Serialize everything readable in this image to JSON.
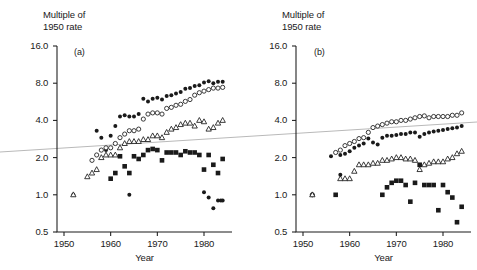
{
  "figure": {
    "background_color": "#ffffff",
    "ink_color": "#1a1a1a",
    "trendline_color": "#b9b9b9",
    "axis_title_line1": "Multiple of",
    "axis_title_line2": "1950 rate",
    "xaxis_label": "Year"
  },
  "annotation_line": {
    "description": "faint grey diagonal line spanning full image width",
    "x1": 0,
    "y1": 152,
    "x2": 477,
    "y2": 122
  },
  "panels": [
    {
      "id": "a",
      "letter": "(a)"
    },
    {
      "id": "b",
      "letter": "(b)"
    }
  ],
  "axes": {
    "y_ticks": [
      "16.0",
      "8.0",
      "4.0",
      "2.0",
      "1.0",
      "0.5"
    ],
    "y_tick_values": [
      16.0,
      8.0,
      4.0,
      2.0,
      1.0,
      0.5
    ],
    "x_ticks": [
      "1950",
      "1960",
      "1970",
      "1980"
    ],
    "x_tick_values": [
      1950,
      1960,
      1970,
      1980
    ],
    "y_scale": "log",
    "ylim": [
      0.5,
      16.0
    ],
    "xlim": [
      1948.5,
      1986.0
    ]
  },
  "chart_data": [
    {
      "type": "scatter",
      "panel": "(a)",
      "title": "Multiple of 1950 rate",
      "xlabel": "Year",
      "ylabel": "Multiple of 1950 rate",
      "yscale": "log",
      "ylim": [
        0.5,
        16.0
      ],
      "xlim": [
        1948.5,
        1986.0
      ],
      "grid": false,
      "legend": "none",
      "series": [
        {
          "name": "filled-circle",
          "marker": "filled circle",
          "x": [
            1952,
            1957,
            1958,
            1959,
            1960,
            1961,
            1962,
            1963,
            1964,
            1965,
            1966,
            1967,
            1968,
            1969,
            1970,
            1971,
            1972,
            1973,
            1974,
            1975,
            1976,
            1977,
            1978,
            1979,
            1980,
            1981,
            1982,
            1983,
            1984
          ],
          "y": [
            1.0,
            3.3,
            2.9,
            2.3,
            3.0,
            3.6,
            4.3,
            4.4,
            4.3,
            4.3,
            4.5,
            6.0,
            5.7,
            6.0,
            6.1,
            5.9,
            6.3,
            6.4,
            6.6,
            6.8,
            7.2,
            7.3,
            7.6,
            7.7,
            8.1,
            8.3,
            8.0,
            8.2,
            8.2
          ]
        },
        {
          "name": "open-circle",
          "marker": "open circle",
          "x": [
            1956,
            1957,
            1958,
            1959,
            1960,
            1961,
            1962,
            1963,
            1964,
            1965,
            1966,
            1967,
            1968,
            1969,
            1970,
            1971,
            1972,
            1973,
            1974,
            1975,
            1976,
            1977,
            1978,
            1979,
            1980,
            1981,
            1982,
            1983,
            1984
          ],
          "y": [
            1.9,
            2.1,
            2.3,
            2.4,
            2.4,
            2.6,
            2.9,
            3.1,
            3.3,
            3.3,
            3.4,
            4.1,
            4.5,
            4.6,
            4.6,
            4.5,
            5.0,
            5.1,
            5.3,
            5.4,
            5.7,
            5.9,
            6.4,
            6.7,
            6.9,
            7.1,
            7.3,
            7.3,
            7.4
          ]
        },
        {
          "name": "open-triangle",
          "marker": "open triangle",
          "x": [
            1952,
            1955,
            1956,
            1957,
            1958,
            1959,
            1960,
            1961,
            1962,
            1963,
            1964,
            1965,
            1966,
            1967,
            1968,
            1969,
            1970,
            1971,
            1972,
            1973,
            1974,
            1975,
            1976,
            1977,
            1978,
            1979,
            1980,
            1981,
            1982,
            1983,
            1984
          ],
          "y": [
            1.0,
            1.4,
            1.5,
            1.6,
            2.0,
            2.1,
            2.1,
            2.1,
            2.4,
            2.6,
            2.7,
            2.7,
            2.7,
            2.8,
            2.8,
            3.0,
            3.0,
            2.9,
            3.2,
            3.4,
            3.5,
            3.7,
            3.8,
            3.8,
            3.6,
            4.0,
            3.9,
            3.4,
            3.5,
            3.8,
            4.0
          ]
        },
        {
          "name": "filled-square",
          "marker": "filled square",
          "x": [
            1960,
            1961,
            1962,
            1963,
            1964,
            1965,
            1966,
            1967,
            1968,
            1969,
            1970,
            1971,
            1972,
            1973,
            1974,
            1975,
            1976,
            1977,
            1978,
            1979,
            1980,
            1981,
            1982,
            1983,
            1984
          ],
          "y": [
            1.35,
            1.5,
            2.05,
            1.7,
            1.5,
            2.05,
            1.95,
            2.1,
            2.3,
            2.35,
            2.3,
            1.9,
            2.2,
            2.2,
            2.2,
            2.1,
            2.25,
            2.2,
            2.2,
            2.1,
            1.6,
            2.1,
            1.75,
            1.5,
            1.95
          ]
        },
        {
          "name": "filled-circle-low",
          "marker": "filled circle",
          "x": [
            1964,
            1980,
            1981,
            1982,
            1983,
            1983.6,
            1984
          ],
          "y": [
            1.0,
            1.05,
            0.95,
            0.78,
            0.9,
            0.9,
            0.9
          ]
        }
      ]
    },
    {
      "type": "scatter",
      "panel": "(b)",
      "title": "Multiple of 1950 rate",
      "xlabel": "Year",
      "ylabel": "Multiple of 1950 rate",
      "yscale": "log",
      "ylim": [
        0.5,
        16.0
      ],
      "xlim": [
        1948.5,
        1986.0
      ],
      "grid": false,
      "legend": "none",
      "series": [
        {
          "name": "open-circle",
          "marker": "open circle",
          "x": [
            1952,
            1957,
            1958,
            1959,
            1960,
            1961,
            1962,
            1963,
            1964,
            1965,
            1966,
            1967,
            1968,
            1969,
            1970,
            1971,
            1972,
            1973,
            1974,
            1975,
            1976,
            1977,
            1978,
            1979,
            1980,
            1981,
            1982,
            1983,
            1984
          ],
          "y": [
            1.0,
            2.2,
            2.3,
            2.5,
            2.6,
            2.7,
            2.85,
            2.9,
            3.2,
            3.5,
            3.6,
            3.7,
            3.8,
            3.9,
            3.9,
            4.0,
            4.0,
            4.1,
            4.2,
            4.3,
            4.35,
            4.2,
            4.3,
            4.3,
            4.3,
            4.3,
            4.4,
            4.4,
            4.6
          ]
        },
        {
          "name": "filled-circle",
          "marker": "filled circle",
          "x": [
            1952,
            1956,
            1958,
            1959,
            1960,
            1961,
            1962,
            1963,
            1964,
            1965,
            1966,
            1967,
            1968,
            1969,
            1970,
            1971,
            1972,
            1973,
            1974,
            1975,
            1976,
            1977,
            1978,
            1979,
            1980,
            1981,
            1982,
            1983,
            1984
          ],
          "y": [
            1.0,
            2.05,
            2.1,
            2.15,
            2.25,
            2.4,
            2.5,
            2.6,
            2.85,
            2.65,
            2.55,
            2.9,
            3.0,
            3.0,
            3.05,
            3.1,
            3.1,
            3.2,
            3.2,
            2.95,
            3.1,
            3.2,
            3.25,
            3.3,
            3.35,
            3.4,
            3.45,
            3.5,
            3.6
          ]
        },
        {
          "name": "open-triangle",
          "marker": "open triangle",
          "x": [
            1952,
            1958,
            1959,
            1960,
            1961,
            1962,
            1963,
            1964,
            1965,
            1966,
            1967,
            1968,
            1969,
            1970,
            1971,
            1972,
            1973,
            1974,
            1975,
            1976,
            1977,
            1978,
            1979,
            1980,
            1981,
            1982,
            1983,
            1984
          ],
          "y": [
            1.0,
            1.35,
            1.35,
            1.35,
            1.55,
            1.75,
            1.75,
            1.75,
            1.8,
            1.8,
            1.9,
            1.9,
            1.95,
            2.0,
            2.0,
            1.95,
            1.95,
            1.9,
            1.6,
            1.75,
            1.8,
            1.85,
            1.85,
            1.85,
            1.95,
            2.0,
            2.15,
            2.25
          ]
        },
        {
          "name": "filled-square",
          "marker": "filled square",
          "x": [
            1957,
            1967,
            1968,
            1969,
            1970,
            1971,
            1972,
            1973,
            1974,
            1975,
            1976,
            1977,
            1978,
            1979,
            1980,
            1981,
            1982,
            1983,
            1984
          ],
          "y": [
            1.0,
            1.0,
            1.15,
            1.25,
            1.3,
            1.3,
            1.2,
            0.88,
            1.25,
            1.75,
            1.2,
            1.2,
            1.2,
            0.75,
            1.2,
            1.05,
            0.95,
            0.6,
            0.8
          ]
        },
        {
          "name": "filled-circle-low",
          "marker": "filled circle",
          "x": [
            1958
          ],
          "y": [
            1.45
          ]
        }
      ]
    }
  ]
}
